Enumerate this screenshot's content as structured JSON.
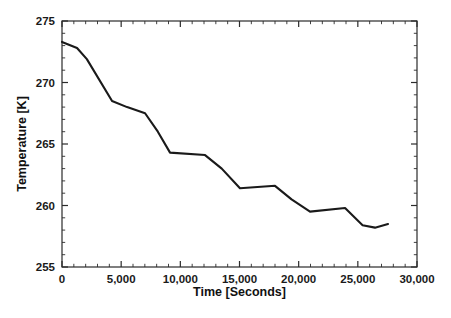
{
  "chart_data": {
    "type": "line",
    "title": "",
    "subtitle": "",
    "xlabel": "Time [Seconds]",
    "ylabel": "Temperature [K]",
    "xlim": [
      0,
      30000
    ],
    "ylim": [
      255,
      275
    ],
    "grid": false,
    "legend": false,
    "legend_position": "none",
    "line_color": "#1a1a1a",
    "background_color": "#ffffff",
    "axis_color": "#2b2b2b",
    "xticks": [
      0,
      5000,
      10000,
      15000,
      20000,
      25000,
      30000
    ],
    "xtick_labels": [
      "0",
      "5,000",
      "10,000",
      "15,000",
      "20,000",
      "25,000",
      "30,000"
    ],
    "x_minor_tick_interval": 1000,
    "yticks": [
      255,
      260,
      265,
      270,
      275
    ],
    "ytick_labels": [
      "255",
      "260",
      "265",
      "270",
      "275"
    ],
    "y_minor_tick_interval": 1,
    "series": [
      {
        "name": "Temperature",
        "x": [
          0,
          1270,
          2100,
          4230,
          5500,
          7020,
          8100,
          9130,
          12090,
          13500,
          15040,
          18000,
          19400,
          20960,
          23920,
          25400,
          26450,
          27550
        ],
        "y": [
          273.3,
          272.8,
          271.9,
          268.5,
          268.0,
          267.5,
          266.0,
          264.3,
          264.1,
          263.0,
          261.4,
          261.6,
          260.5,
          259.5,
          259.8,
          258.4,
          258.2,
          258.5
        ]
      }
    ]
  },
  "figure": {
    "x_axis_label": "Time [Seconds]",
    "y_axis_label": "Temperature [K]"
  }
}
